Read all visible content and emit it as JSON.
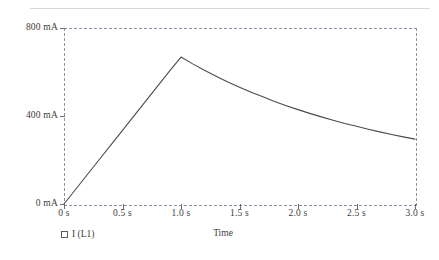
{
  "chart_data": {
    "type": "line",
    "title": "",
    "xlabel": "Time",
    "ylabel": "",
    "xlim": [
      0,
      3.0
    ],
    "ylim": [
      0,
      800
    ],
    "grid": false,
    "legend_position": "bottom-left",
    "series": [
      {
        "name": "I (L1)",
        "units": "mA",
        "color": "#4a4a52",
        "x": [
          0.0,
          0.1,
          0.2,
          0.3,
          0.4,
          0.5,
          0.6,
          0.7,
          0.8,
          0.9,
          1.0,
          1.1,
          1.2,
          1.3,
          1.4,
          1.5,
          1.6,
          1.7,
          1.8,
          1.9,
          2.0,
          2.1,
          2.2,
          2.3,
          2.4,
          2.5,
          2.6,
          2.7,
          2.8,
          2.9,
          3.0
        ],
        "values": [
          0,
          67,
          134,
          201,
          268,
          335,
          402,
          469,
          536,
          603,
          668,
          637,
          608,
          581,
          555,
          531,
          508,
          487,
          466,
          447,
          429,
          412,
          396,
          381,
          366,
          353,
          340,
          328,
          316,
          305,
          295
        ]
      }
    ],
    "yticks": [
      {
        "value": 0,
        "label": "0 mA"
      },
      {
        "value": 400,
        "label": "400 mA"
      },
      {
        "value": 800,
        "label": "800 mA"
      }
    ],
    "xticks": [
      {
        "value": 0.0,
        "label": "0 s"
      },
      {
        "value": 0.5,
        "label": "0.5 s"
      },
      {
        "value": 1.0,
        "label": "1.0 s"
      },
      {
        "value": 1.5,
        "label": "1.5 s"
      },
      {
        "value": 2.0,
        "label": "2.0 s"
      },
      {
        "value": 2.5,
        "label": "2.5 s"
      },
      {
        "value": 3.0,
        "label": "3.0 s"
      }
    ],
    "legend_entries": [
      {
        "label": "I (L1)",
        "marker": "open-square",
        "color": "#5a5a66"
      }
    ],
    "annotations": {
      "peak_time_s": 1.0,
      "peak_value_mA": 668
    },
    "axis_style": "dashed",
    "axis_color": "#8f8fa8",
    "line_color": "#4a4a52",
    "top_rule_color": "#d9d9d9"
  }
}
